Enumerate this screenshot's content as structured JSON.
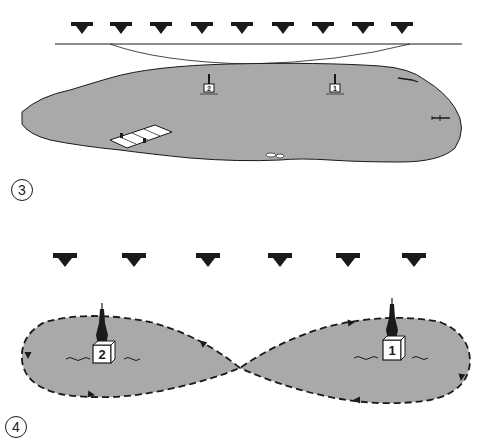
{
  "panels": [
    {
      "label": "3",
      "description": "Lake with two pylons, dock, and aircraft; wind from above",
      "wind_arrow_count": 9,
      "pylons": [
        {
          "number": "2"
        },
        {
          "number": "1"
        }
      ]
    },
    {
      "label": "4",
      "description": "Figure-eight flight path around pylons; wind from above",
      "wind_arrow_count": 6,
      "pylons": [
        {
          "number": "2"
        },
        {
          "number": "1"
        }
      ]
    }
  ],
  "colors": {
    "water": "#a9a9a9",
    "ink": "#1a1a1a",
    "background": "#ffffff"
  }
}
